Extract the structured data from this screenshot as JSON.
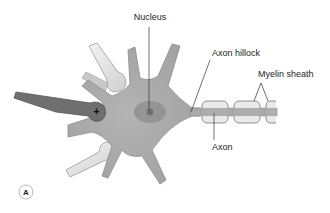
{
  "figure": {
    "panel_label": "A",
    "labels": {
      "nucleus": "Nucleus",
      "axon_hillock": "Axon hillock",
      "myelin_sheath": "Myelin sheath",
      "axon": "Axon"
    },
    "synapse_symbol": "+",
    "colors": {
      "cell_body": "#a9a9a9",
      "cell_outline": "#8c8c8c",
      "nucleus": "#8f8f8f",
      "nucleolus": "#6e6e6e",
      "excitatory_terminal": "#6f6f6f",
      "inhibitory_terminal": "#e2e2e2",
      "myelin": "#e8e8e8",
      "leader_line": "#333333",
      "text": "#222222"
    }
  }
}
